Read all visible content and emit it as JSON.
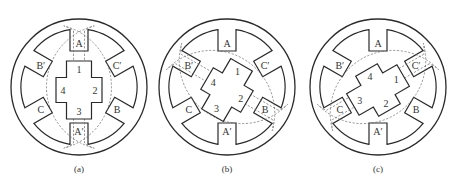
{
  "figure": {
    "colors": {
      "line": "#2a2a2a",
      "flux": "#6a6a6a",
      "background": "#ffffff"
    }
  },
  "panels": [
    {
      "caption": "(a)",
      "center": [
        79,
        87
      ],
      "rotor_angle_deg": 0,
      "excited_phase": "A",
      "flux_axis_deg": 90,
      "stator_labels": [
        "A",
        "C′",
        "B",
        "A′",
        "C",
        "B′"
      ],
      "rotor_labels": [
        "1",
        "2",
        "3",
        "4"
      ]
    },
    {
      "caption": "(b)",
      "center": [
        227,
        87
      ],
      "rotor_angle_deg": -30,
      "excited_phase": "B",
      "flux_axis_deg": -30,
      "stator_labels": [
        "A",
        "C′",
        "B",
        "A′",
        "C",
        "B′"
      ],
      "rotor_labels": [
        "1",
        "2",
        "3",
        "4"
      ]
    },
    {
      "caption": "(c)",
      "center": [
        378,
        87
      ],
      "rotor_angle_deg": -60,
      "excited_phase": "C",
      "flux_axis_deg": 30,
      "stator_labels": [
        "A",
        "C′",
        "B",
        "A′",
        "C",
        "B′"
      ],
      "rotor_labels": [
        "1",
        "2",
        "3",
        "4"
      ]
    }
  ]
}
